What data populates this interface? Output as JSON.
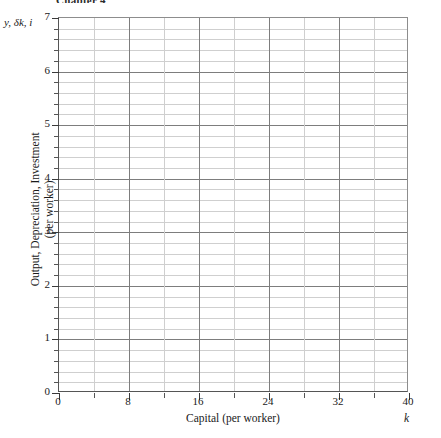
{
  "page": {
    "header_clipped": "Chapter 4"
  },
  "chart_data": {
    "type": "line",
    "title": "",
    "subtitle": "",
    "xlabel": "Capital (per worker)",
    "ylabel": "Output, Depreciation, Investment",
    "ylabel_line2": "(per worker)",
    "x_variable_symbol": "k",
    "y_variable_symbol": "y, δk, i",
    "xlim": [
      0,
      40
    ],
    "ylim": [
      0,
      7
    ],
    "x_major_ticks": [
      0,
      8,
      16,
      24,
      32,
      40
    ],
    "x_minor_step": 4,
    "y_major_ticks": [
      0,
      1,
      2,
      3,
      4,
      5,
      6,
      7
    ],
    "y_minor_step": 0.2,
    "x_tick_labels": [
      "0",
      "8",
      "16",
      "24",
      "32",
      "40"
    ],
    "y_tick_labels": [
      "0",
      "1",
      "2",
      "3",
      "4",
      "5",
      "6",
      "7"
    ],
    "grid": true,
    "grid_major_color": "#7d7d7d",
    "grid_minor_color": "#cfcfcf",
    "axis_color": "#555555",
    "background": "#ffffff",
    "legend": [],
    "series": [],
    "annotations": []
  }
}
